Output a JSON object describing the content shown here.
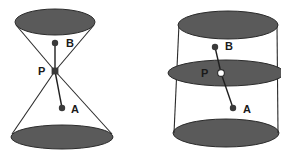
{
  "figure": {
    "title": "",
    "background_color": "#ffffff",
    "surface_fill": "#5a5a5a",
    "stroke_color": "#2b2b2b",
    "point_fill": "#3a3a3a",
    "open_point_fill": "#ffffff",
    "width": 281,
    "height": 154
  },
  "panels": [
    {
      "id": "left-panel",
      "name": "double-cone-diagram",
      "shape": "double-cone",
      "labels": [
        {
          "text": "B",
          "x": 66,
          "y": 47
        },
        {
          "text": "P",
          "x": 38,
          "y": 75
        },
        {
          "text": "A",
          "x": 71,
          "y": 113
        }
      ],
      "ellipses": [
        {
          "name": "top-ellipse",
          "cx": 55,
          "cy": 22,
          "rx": 40,
          "ry": 13,
          "filled": true
        },
        {
          "name": "bottom-ellipse",
          "cx": 62,
          "cy": 137,
          "rx": 51,
          "ry": 12,
          "filled": true
        }
      ],
      "points": [
        {
          "name": "point-b",
          "label": "B",
          "cx": 55,
          "cy": 43,
          "r": 3.2,
          "style": "filled"
        },
        {
          "name": "apex-p",
          "label": "P",
          "cx": 55,
          "cy": 71,
          "r": 3.4,
          "style": "square"
        },
        {
          "name": "point-a",
          "label": "A",
          "cx": 62,
          "cy": 108,
          "r": 3.2,
          "style": "filled"
        }
      ],
      "generator_lines": [
        {
          "name": "generator-upper-left",
          "x1": 16,
          "y1": 25,
          "x2": 55,
          "y2": 71
        },
        {
          "name": "generator-upper-right",
          "x1": 94,
          "y1": 25,
          "x2": 55,
          "y2": 71
        },
        {
          "name": "generator-lower-left",
          "x1": 12,
          "y1": 134,
          "x2": 55,
          "y2": 71
        },
        {
          "name": "generator-lower-right",
          "x1": 112,
          "y1": 134,
          "x2": 55,
          "y2": 71
        }
      ],
      "segments": [
        {
          "name": "segment-b-p",
          "x1": 55,
          "y1": 43,
          "x2": 55,
          "y2": 71
        },
        {
          "name": "segment-p-a",
          "x1": 55,
          "y1": 71,
          "x2": 62,
          "y2": 108
        }
      ]
    },
    {
      "id": "right-panel",
      "name": "cylinder-diagram",
      "shape": "cylinder",
      "labels": [
        {
          "text": "B",
          "x": 225,
          "y": 50
        },
        {
          "text": "P",
          "x": 201,
          "y": 77
        },
        {
          "text": "A",
          "x": 243,
          "y": 113
        }
      ],
      "ellipses": [
        {
          "name": "top-ellipse",
          "cx": 228,
          "cy": 25,
          "rx": 50,
          "ry": 14,
          "filled": true
        },
        {
          "name": "middle-ellipse",
          "cx": 226,
          "cy": 73,
          "rx": 58,
          "ry": 13,
          "filled": true
        },
        {
          "name": "bottom-ellipse",
          "cx": 226,
          "cy": 133,
          "rx": 53,
          "ry": 14,
          "filled": true
        }
      ],
      "points": [
        {
          "name": "point-b",
          "label": "B",
          "cx": 215,
          "cy": 47,
          "r": 3.2,
          "style": "filled"
        },
        {
          "name": "point-p",
          "label": "P",
          "cx": 221,
          "cy": 73,
          "r": 3.4,
          "style": "open"
        },
        {
          "name": "point-a",
          "label": "A",
          "cx": 233,
          "cy": 108,
          "r": 3.2,
          "style": "filled"
        }
      ],
      "side_lines": [
        {
          "name": "side-line-left",
          "x1": 179,
          "y1": 24,
          "x2": 174,
          "y2": 133
        },
        {
          "name": "side-line-right",
          "x1": 277,
          "y1": 24,
          "x2": 278,
          "y2": 133
        }
      ],
      "segments": [
        {
          "name": "segment-b-p",
          "x1": 215,
          "y1": 47,
          "x2": 221,
          "y2": 73
        },
        {
          "name": "segment-p-a",
          "x1": 221,
          "y1": 73,
          "x2": 233,
          "y2": 108
        }
      ]
    }
  ]
}
